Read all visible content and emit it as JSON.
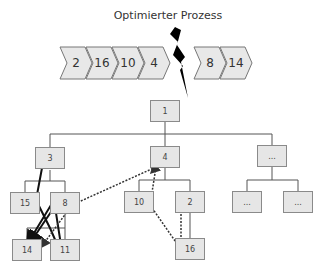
{
  "title": "Optimierter Prozess",
  "process_before_break": [
    {
      "label": "2"
    },
    {
      "label": "16"
    },
    {
      "label": "10"
    },
    {
      "label": "4"
    }
  ],
  "process_after_break": [
    {
      "label": "8"
    },
    {
      "label": "14"
    }
  ],
  "tree": {
    "root": "1",
    "level1": [
      "3",
      "4",
      "..."
    ],
    "level2": {
      "under_3": [
        "15",
        "8"
      ],
      "under_4": [
        "10",
        "2"
      ],
      "under_dots": [
        "...",
        "..."
      ]
    },
    "level3": {
      "under_8": [
        "14",
        "11"
      ],
      "under_2": [
        "16"
      ]
    }
  },
  "colors": {
    "box_fill": "#e6e6e6",
    "box_border": "#8a8a8a",
    "chevron_fill": "#e8e8e8",
    "line": "#555555",
    "arrow": "#111111"
  }
}
